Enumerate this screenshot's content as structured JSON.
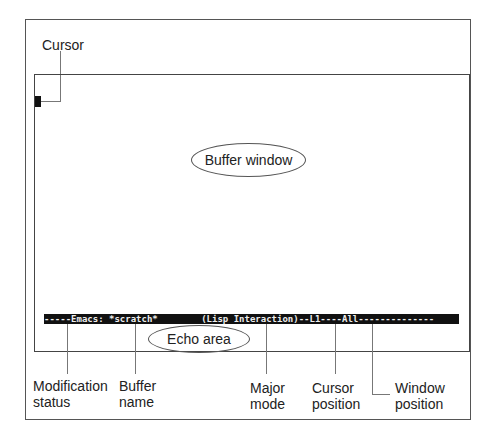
{
  "diagram": {
    "title_callout": "Cursor",
    "buffer_window_label": "Buffer window",
    "echo_area_label": "Echo area",
    "mode_line": {
      "text": "-----Emacs: *scratch*        (Lisp Interaction)--L1----All--------------",
      "segments": {
        "modification_status": "-----",
        "buffer_name": "*scratch*",
        "major_mode": "(Lisp Interaction)",
        "cursor_position": "L1",
        "window_position": "All"
      }
    },
    "callouts": [
      {
        "line1": "Modification",
        "line2": "status"
      },
      {
        "line1": "Buffer",
        "line2": "name"
      },
      {
        "line1": "Major",
        "line2": "mode"
      },
      {
        "line1": "Cursor",
        "line2": "position"
      },
      {
        "line1": "Window",
        "line2": "position"
      }
    ]
  }
}
